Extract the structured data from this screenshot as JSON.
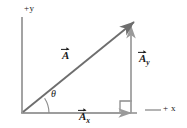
{
  "figure": {
    "colors": {
      "axis": "#8c8c8c",
      "vector": "#6e6e6e",
      "component": "#9a9a9a",
      "text": "#1a1a1a",
      "background": "#ffffff"
    },
    "labels": {
      "y_axis": "+y",
      "x_axis": "+ x",
      "vector_a": "A",
      "vector_ay_base": "A",
      "vector_ay_sub": "y",
      "vector_ax_base": "A",
      "vector_ax_sub": "x",
      "angle": "θ"
    },
    "geometry": {
      "origin": {
        "x": 22,
        "y": 113
      },
      "tip": {
        "x": 133,
        "y": 22
      },
      "y_axis_top": {
        "x": 22,
        "y": 17
      },
      "x_axis_end": {
        "x": 187,
        "y": 113
      },
      "right_angle_marker": {
        "x": 120,
        "y": 99,
        "size": 12
      }
    }
  }
}
